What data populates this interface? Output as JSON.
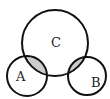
{
  "diagram": {
    "type": "venn",
    "sets": [
      {
        "label": "C",
        "cx": 55,
        "cy": 43,
        "r": 33
      },
      {
        "label": "A",
        "cx": 27,
        "cy": 76,
        "r": 20
      },
      {
        "label": "B",
        "cx": 87,
        "cy": 76,
        "r": 19
      }
    ],
    "shaded_regions": [
      "A∩C",
      "B∩C"
    ],
    "colors": {
      "stroke": "#111111",
      "shade": "#cccccc",
      "background": "#ffffff"
    }
  }
}
